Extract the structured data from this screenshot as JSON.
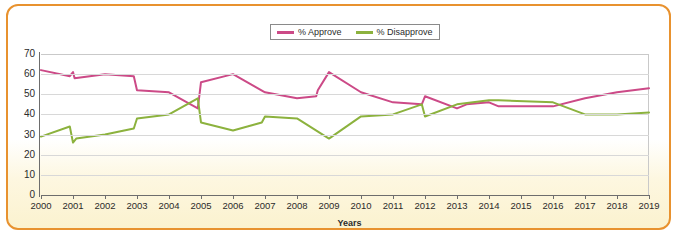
{
  "chart_data": {
    "type": "line",
    "title": "",
    "xlabel": "Years",
    "ylabel": "",
    "xlim": [
      2000,
      2019
    ],
    "ylim": [
      0,
      70
    ],
    "grid": true,
    "legend_position": "top-center",
    "categories": [
      "2000",
      "2001",
      "2002",
      "2003",
      "2004",
      "2005",
      "2006",
      "2007",
      "2008",
      "2009",
      "2010",
      "2011",
      "2012",
      "2013",
      "2014",
      "2015",
      "2016",
      "2017",
      "2018",
      "2019"
    ],
    "y_ticks": [
      "0",
      "10",
      "20",
      "30",
      "40",
      "50",
      "60",
      "70"
    ],
    "series": [
      {
        "name": "% Approve",
        "color": "#cc4a87",
        "values": [
          62,
          58,
          60,
          52,
          51,
          56,
          60,
          51,
          48,
          61,
          51,
          46,
          45,
          43,
          44,
          44,
          44,
          48,
          51,
          53
        ],
        "points": [
          {
            "x": 2000.0,
            "y": 62
          },
          {
            "x": 2000.9,
            "y": 59
          },
          {
            "x": 2001.0,
            "y": 61
          },
          {
            "x": 2001.05,
            "y": 58
          },
          {
            "x": 2002.0,
            "y": 60
          },
          {
            "x": 2002.9,
            "y": 59
          },
          {
            "x": 2003.0,
            "y": 52
          },
          {
            "x": 2004.0,
            "y": 51
          },
          {
            "x": 2004.9,
            "y": 43
          },
          {
            "x": 2005.0,
            "y": 56
          },
          {
            "x": 2006.0,
            "y": 60
          },
          {
            "x": 2007.0,
            "y": 51
          },
          {
            "x": 2008.0,
            "y": 48
          },
          {
            "x": 2008.6,
            "y": 49
          },
          {
            "x": 2008.65,
            "y": 52
          },
          {
            "x": 2009.0,
            "y": 61
          },
          {
            "x": 2010.0,
            "y": 51
          },
          {
            "x": 2011.0,
            "y": 46
          },
          {
            "x": 2011.9,
            "y": 45
          },
          {
            "x": 2012.0,
            "y": 49
          },
          {
            "x": 2013.0,
            "y": 43
          },
          {
            "x": 2013.3,
            "y": 45
          },
          {
            "x": 2014.0,
            "y": 46
          },
          {
            "x": 2014.3,
            "y": 44
          },
          {
            "x": 2016.0,
            "y": 44
          },
          {
            "x": 2017.0,
            "y": 48
          },
          {
            "x": 2018.0,
            "y": 51
          },
          {
            "x": 2019.0,
            "y": 53
          }
        ]
      },
      {
        "name": "% Disapprove",
        "color": "#8cb23e",
        "values": [
          29,
          28,
          30,
          38,
          40,
          36,
          32,
          38,
          38,
          28,
          39,
          40,
          45,
          45,
          47,
          47,
          46,
          40,
          40,
          41
        ],
        "points": [
          {
            "x": 2000.0,
            "y": 29
          },
          {
            "x": 2000.9,
            "y": 34
          },
          {
            "x": 2001.0,
            "y": 26
          },
          {
            "x": 2001.1,
            "y": 28
          },
          {
            "x": 2002.0,
            "y": 30
          },
          {
            "x": 2002.9,
            "y": 33
          },
          {
            "x": 2003.0,
            "y": 38
          },
          {
            "x": 2004.0,
            "y": 40
          },
          {
            "x": 2004.9,
            "y": 48
          },
          {
            "x": 2005.0,
            "y": 36
          },
          {
            "x": 2006.0,
            "y": 32
          },
          {
            "x": 2006.9,
            "y": 36
          },
          {
            "x": 2007.0,
            "y": 39
          },
          {
            "x": 2008.0,
            "y": 38
          },
          {
            "x": 2009.0,
            "y": 28
          },
          {
            "x": 2010.0,
            "y": 39
          },
          {
            "x": 2011.0,
            "y": 40
          },
          {
            "x": 2011.9,
            "y": 45
          },
          {
            "x": 2012.0,
            "y": 39
          },
          {
            "x": 2013.0,
            "y": 45
          },
          {
            "x": 2014.0,
            "y": 47
          },
          {
            "x": 2014.3,
            "y": 47
          },
          {
            "x": 2016.0,
            "y": 46
          },
          {
            "x": 2017.0,
            "y": 40
          },
          {
            "x": 2018.0,
            "y": 40
          },
          {
            "x": 2019.0,
            "y": 41
          }
        ]
      }
    ]
  },
  "legend": {
    "approve_label": "% Approve",
    "disapprove_label": "% Disapprove"
  },
  "axes": {
    "x_title": "Years"
  },
  "colors": {
    "approve": "#cc4a87",
    "disapprove": "#8cb23e",
    "border": "#e8922f",
    "grid": "#d8d8d8",
    "axis": "#6d6d6d"
  }
}
